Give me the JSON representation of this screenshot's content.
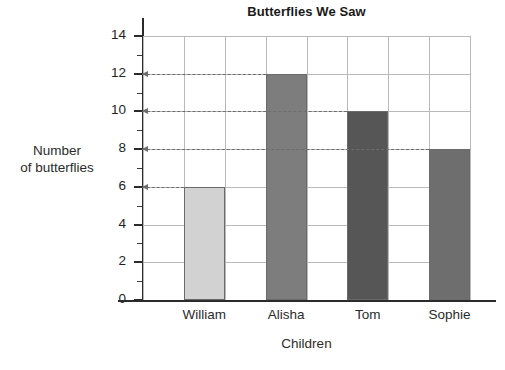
{
  "chart_data": {
    "type": "bar",
    "title": "Butterflies We Saw",
    "xlabel": "Children",
    "ylabel_line1": "Number",
    "ylabel_line2": "of butterflies",
    "categories": [
      "William",
      "Alisha",
      "Tom",
      "Sophie"
    ],
    "values": [
      6,
      12,
      10,
      8
    ],
    "ylim": [
      0,
      14
    ],
    "ytick_labels": [
      "0",
      "2",
      "4",
      "6",
      "8",
      "10",
      "12",
      "14"
    ],
    "ytick_values": [
      0,
      2,
      4,
      6,
      8,
      10,
      12,
      14
    ],
    "minor_tick_step": 1,
    "grid": true,
    "legend": "none",
    "bar_colors": [
      "#d2d2d2",
      "#7d7d7d",
      "#565656",
      "#6e6e6e"
    ],
    "bar_border_color": "#6a6a6a",
    "grid_color": "#b9b9b9",
    "axis_color": "#2b2b2b",
    "annotation_color": "#6d6d6d",
    "annotations": [
      {
        "label": "William",
        "value": 6,
        "arrow": "left-to-axis"
      },
      {
        "label": "Alisha",
        "value": 12,
        "arrow": "left-to-axis"
      },
      {
        "label": "Tom",
        "value": 10,
        "arrow": "left-to-axis"
      },
      {
        "label": "Sophie",
        "value": 8,
        "arrow": "left-to-axis"
      }
    ]
  }
}
